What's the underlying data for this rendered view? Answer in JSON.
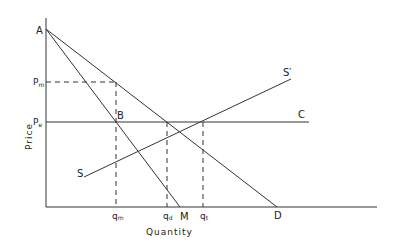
{
  "diagram": {
    "axes": {
      "x_label": "Quantity",
      "y_label": "Price"
    },
    "price_labels": {
      "pm": "P",
      "pm_sub": "m",
      "pe": "P",
      "pe_sub": "e"
    },
    "quantity_labels": {
      "qm": "q",
      "qm_sub": "m",
      "qd": "q",
      "qd_sub": "d",
      "qt": "q",
      "qt_sub": "t"
    },
    "point_labels": {
      "a": "A",
      "b": "B",
      "c": "C",
      "d": "D",
      "m": "M",
      "s": "S",
      "s_prime": "S′"
    },
    "curves": [
      {
        "name": "demand",
        "from": "A",
        "to": "D"
      },
      {
        "name": "marginal-revenue",
        "from": "A",
        "to": "M"
      },
      {
        "name": "supply",
        "from": "S",
        "to": "S′"
      },
      {
        "name": "competitive-price",
        "from": "Pe",
        "to": "C"
      }
    ],
    "colors": {
      "line": "#333333",
      "background": "#ffffff"
    }
  }
}
